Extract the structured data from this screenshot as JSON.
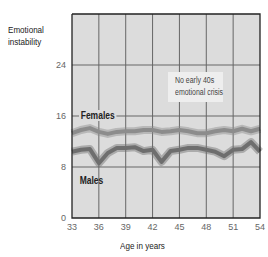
{
  "chart_data": {
    "type": "line",
    "title": "",
    "xlabel": "Age in years",
    "ylabel": "Emotional instability",
    "xlim": [
      33,
      54
    ],
    "ylim": [
      0,
      32
    ],
    "x_ticks": [
      33,
      36,
      39,
      42,
      45,
      48,
      51,
      54
    ],
    "y_ticks": [
      0,
      8,
      16,
      24
    ],
    "grid": true,
    "legend": "inline labels",
    "x": [
      33,
      34,
      35,
      36,
      37,
      38,
      39,
      40,
      41,
      42,
      43,
      44,
      45,
      46,
      47,
      48,
      49,
      50,
      51,
      52,
      53,
      54
    ],
    "series": [
      {
        "name": "Females",
        "color": "#8c8c8c",
        "values": [
          13.3,
          13.8,
          14.1,
          13.5,
          13.2,
          13.5,
          13.6,
          13.6,
          13.8,
          13.8,
          13.5,
          13.6,
          13.8,
          13.6,
          13.3,
          13.3,
          13.6,
          13.8,
          13.6,
          14.0,
          13.6,
          14.0
        ]
      },
      {
        "name": "Males",
        "color": "#6e6e6e",
        "values": [
          10.4,
          10.7,
          10.8,
          8.6,
          10.2,
          11.0,
          11.0,
          11.1,
          10.5,
          10.7,
          8.8,
          10.5,
          10.7,
          11.0,
          11.0,
          10.7,
          10.4,
          9.7,
          10.7,
          10.8,
          11.9,
          10.4
        ]
      }
    ],
    "annotations": [
      {
        "text": "No early 40s emotional crisis",
        "x": 45,
        "y": 23
      }
    ]
  },
  "labels": {
    "ylabel_line1": "Emotional",
    "ylabel_line2": "instability",
    "xlabel": "Age in years",
    "annotation_line1": "No early 40s",
    "annotation_line2": "emotional crisis",
    "females": "Females",
    "males": "Males"
  },
  "colors": {
    "plot_bg": "#dcdcdc",
    "grid": "#555555",
    "axis": "#222222",
    "females_line": "#8c8c8c",
    "males_line": "#6e6e6e"
  }
}
